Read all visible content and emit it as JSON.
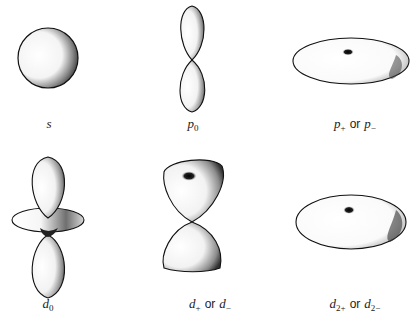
{
  "figure": {
    "orbitals": [
      {
        "id": "s",
        "label_main": "s",
        "label_sub": "",
        "label_alt_main": "",
        "label_alt_sub": "",
        "shape": "sphere"
      },
      {
        "id": "p0",
        "label_main": "p",
        "label_sub": "0",
        "label_alt_main": "",
        "label_alt_sub": "",
        "shape": "dumbbell"
      },
      {
        "id": "p_pm",
        "label_main": "p",
        "label_sub": "+",
        "connector": "or",
        "label_alt_main": "p",
        "label_alt_sub": "−",
        "shape": "flat-torus"
      },
      {
        "id": "d0",
        "label_main": "d",
        "label_sub": "0",
        "label_alt_main": "",
        "label_alt_sub": "",
        "shape": "dumbbell-with-ring"
      },
      {
        "id": "d_pm",
        "label_main": "d",
        "label_sub": "+",
        "connector": "or",
        "label_alt_main": "d",
        "label_alt_sub": "−",
        "shape": "double-cone-bowl"
      },
      {
        "id": "d2_pm",
        "label_main": "d",
        "label_sub": "2+",
        "connector": "or",
        "label_alt_main": "d",
        "label_alt_sub": "2−",
        "shape": "thick-torus"
      }
    ]
  }
}
